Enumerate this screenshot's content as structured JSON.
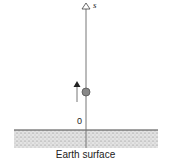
{
  "diagram": {
    "axis_label": "s",
    "origin_label": "0",
    "ground_label": "Earth surface",
    "colors": {
      "axis": "#777777",
      "ball": "#888888",
      "ball_stroke": "#555555",
      "arrow": "#222222",
      "ground_fill": "#d8d8d8",
      "ground_line": "#444444"
    },
    "elements": {
      "ball": "gray ball on vertical axis",
      "velocity_arrow": "upward arrow beside ball"
    }
  }
}
